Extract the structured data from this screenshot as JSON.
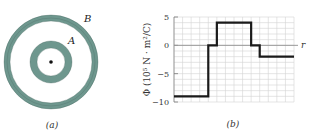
{
  "panel_a": {
    "caption": "(a)",
    "shells": [
      {
        "label": "A",
        "inner_radius": 14,
        "outer_radius": 21
      },
      {
        "label": "B",
        "inner_radius": 41,
        "outer_radius": 47
      }
    ],
    "center_point": "point-charge",
    "shell_color": "#6e978e"
  },
  "panel_b": {
    "caption": "(b)",
    "y_axis_label": "Φ (10⁵ N · m²/C)",
    "x_axis_label": "r"
  },
  "chart_data": {
    "type": "line",
    "title": "",
    "xlabel": "r",
    "ylabel": "Φ (10^5 N·m²/C)",
    "ylim": [
      -10,
      5
    ],
    "yticks": [
      5,
      0,
      -5,
      -10
    ],
    "grid": true,
    "x_grid_columns": 14,
    "series": [
      {
        "name": "flux",
        "step": true,
        "segments": [
          {
            "x_start": 0,
            "x_end": 4,
            "value": -9
          },
          {
            "x_start": 4,
            "x_end": 5,
            "value": 0
          },
          {
            "x_start": 5,
            "x_end": 9,
            "value": 4
          },
          {
            "x_start": 9,
            "x_end": 10,
            "value": 0
          },
          {
            "x_start": 10,
            "x_end": 14,
            "value": -2
          }
        ]
      }
    ]
  }
}
